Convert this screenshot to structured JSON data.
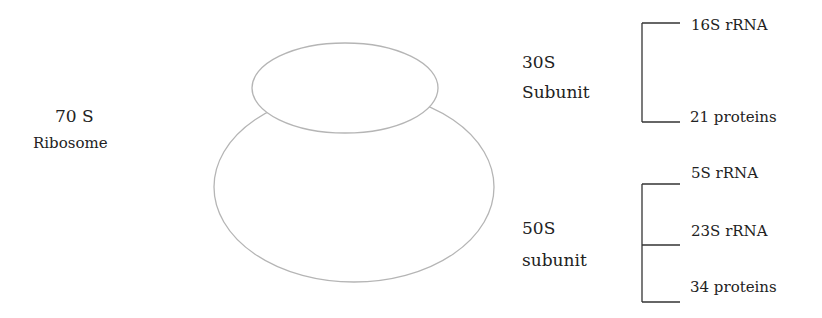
{
  "ribosome": {
    "line1": "70 S",
    "line2": "Ribosome"
  },
  "small_subunit": {
    "line1": "30S",
    "line2": "Subunit",
    "components": [
      "16S rRNA",
      "21 proteins"
    ]
  },
  "large_subunit": {
    "line1": "50S",
    "line2": "subunit",
    "components": [
      "5S rRNA",
      "23S rRNA",
      "34 proteins"
    ]
  },
  "colors": {
    "ellipse_stroke": "#b5b5b5",
    "bracket": "#333333",
    "text": "#222222"
  }
}
